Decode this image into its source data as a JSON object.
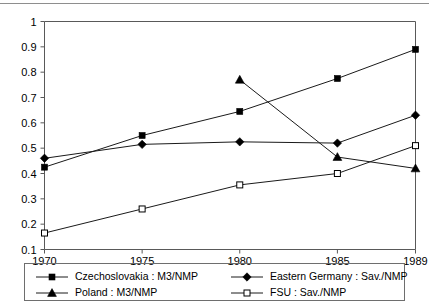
{
  "chart_data": {
    "type": "line",
    "title": "",
    "subtitle": "",
    "xlabel": "",
    "ylabel": "",
    "x": [
      1970,
      1975,
      1980,
      1985,
      1989
    ],
    "categories": [
      "1970",
      "1975",
      "1980",
      "1985",
      "1989"
    ],
    "xtick_labels": [
      "1970",
      "1975",
      "1980",
      "1985",
      "1989"
    ],
    "ytick_labels": [
      "0.1",
      "0.2",
      "0.3",
      "0.4",
      "0.5",
      "0.6",
      "0.7",
      "0.8",
      "0.9",
      "1"
    ],
    "ytick_values": [
      0.1,
      0.2,
      0.3,
      0.4,
      0.5,
      0.6,
      0.7,
      0.8,
      0.9,
      1
    ],
    "ylim": [
      0.1,
      1.0
    ],
    "xlim": [
      1970,
      1989
    ],
    "grid": false,
    "legend_position": "bottom",
    "series": [
      {
        "name": "Czechoslovakia : M3/NMP",
        "marker": "filled-square",
        "color": "#000000",
        "x": [
          1970,
          1975,
          1980,
          1985,
          1989
        ],
        "values": [
          0.425,
          0.55,
          0.645,
          0.775,
          0.89
        ]
      },
      {
        "name": "Eastern Germany : Sav./NMP",
        "marker": "filled-diamond",
        "color": "#000000",
        "x": [
          1970,
          1975,
          1980,
          1985,
          1989
        ],
        "values": [
          0.46,
          0.515,
          0.525,
          0.52,
          0.63
        ]
      },
      {
        "name": "Poland : M3/NMP",
        "marker": "filled-triangle",
        "color": "#000000",
        "x": [
          1980,
          1985,
          1989
        ],
        "values": [
          0.77,
          0.465,
          0.42
        ]
      },
      {
        "name": "FSU : Sav./NMP",
        "marker": "open-square",
        "color": "#000000",
        "x": [
          1970,
          1975,
          1980,
          1985,
          1989
        ],
        "values": [
          0.165,
          0.26,
          0.355,
          0.4,
          0.51
        ]
      }
    ]
  },
  "legend": {
    "entries": [
      {
        "label": "Czechoslovakia : M3/NMP",
        "marker": "filled-square"
      },
      {
        "label": "Eastern Germany : Sav./NMP",
        "marker": "filled-diamond"
      },
      {
        "label": "Poland : M3/NMP",
        "marker": "filled-triangle"
      },
      {
        "label": "FSU : Sav./NMP",
        "marker": "open-square"
      }
    ]
  }
}
